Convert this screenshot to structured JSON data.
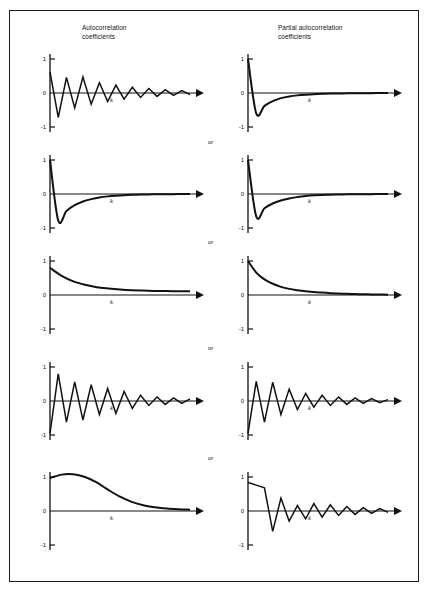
{
  "figure": {
    "frame_color": "#1a1a1a",
    "background": "#ffffff",
    "line_color": "#111111"
  },
  "headers": {
    "left": "Autocorrelation\ncoefficients",
    "right": "Partial autocorrelation\ncoefficients"
  },
  "separators": [
    {
      "label": "or"
    },
    {
      "label": "or"
    },
    {
      "label": "or"
    },
    {
      "label": "or"
    }
  ],
  "axis": {
    "y_ticks": [
      "1",
      "0",
      "-1"
    ],
    "x_label": "k",
    "y_max": 1,
    "y_min": -1,
    "arrowhead": "right-triangle"
  },
  "chart_data": [
    {
      "id": "row1-acf",
      "type": "line",
      "title": "",
      "xlabel": "k",
      "ylabel": "",
      "ylim": [
        -1,
        1
      ],
      "grid": false,
      "pattern": "damped alternating oscillation",
      "x": [
        0,
        1,
        2,
        3,
        4,
        5,
        6,
        7,
        8,
        9,
        10,
        11,
        12,
        13,
        14,
        15,
        16,
        17
      ],
      "values": [
        0.62,
        -0.72,
        0.46,
        -0.44,
        0.47,
        -0.33,
        0.3,
        -0.25,
        0.23,
        -0.18,
        0.17,
        -0.13,
        0.13,
        -0.1,
        0.1,
        -0.07,
        0.07,
        -0.05
      ]
    },
    {
      "id": "row1-pacf",
      "type": "line",
      "title": "",
      "xlabel": "k",
      "ylabel": "",
      "ylim": [
        -1,
        1
      ],
      "grid": false,
      "pattern": "single negative spike then exponential recovery",
      "x": [
        0,
        1,
        2,
        3,
        4,
        5,
        6,
        7,
        8,
        9,
        10,
        11,
        12,
        13,
        14,
        15,
        16,
        17
      ],
      "values": [
        1.0,
        -0.6,
        -0.38,
        -0.24,
        -0.15,
        -0.1,
        -0.07,
        -0.05,
        -0.035,
        -0.025,
        -0.018,
        -0.013,
        -0.01,
        -0.008,
        -0.006,
        -0.004,
        -0.003,
        -0.002
      ]
    },
    {
      "id": "row2-acf",
      "type": "line",
      "title": "",
      "xlabel": "k",
      "ylabel": "",
      "ylim": [
        -1,
        1
      ],
      "grid": false,
      "pattern": "sharp drop to negative then exponential decay to zero",
      "x": [
        0,
        1,
        2,
        3,
        4,
        5,
        6,
        7,
        8,
        9,
        10,
        11,
        12,
        13,
        14,
        15,
        16,
        17
      ],
      "values": [
        1.0,
        -0.78,
        -0.5,
        -0.33,
        -0.22,
        -0.15,
        -0.1,
        -0.07,
        -0.05,
        -0.035,
        -0.025,
        -0.018,
        -0.012,
        -0.009,
        -0.006,
        -0.004,
        -0.003,
        -0.002
      ]
    },
    {
      "id": "row2-pacf",
      "type": "line",
      "title": "",
      "xlabel": "k",
      "ylabel": "",
      "ylim": [
        -1,
        1
      ],
      "grid": false,
      "pattern": "sharp drop to negative then exponential decay to zero",
      "x": [
        0,
        1,
        2,
        3,
        4,
        5,
        6,
        7,
        8,
        9,
        10,
        11,
        12,
        13,
        14,
        15,
        16,
        17
      ],
      "values": [
        1.0,
        -0.66,
        -0.42,
        -0.28,
        -0.19,
        -0.13,
        -0.09,
        -0.06,
        -0.04,
        -0.03,
        -0.02,
        -0.015,
        -0.01,
        -0.007,
        -0.005,
        -0.004,
        -0.002,
        -0.001
      ]
    },
    {
      "id": "row3-acf",
      "type": "line",
      "title": "",
      "xlabel": "k",
      "ylabel": "",
      "ylim": [
        -1,
        1
      ],
      "grid": false,
      "pattern": "positive exponential decay",
      "x": [
        0,
        1,
        2,
        3,
        4,
        5,
        6,
        7,
        8,
        9,
        10,
        11,
        12
      ],
      "values": [
        0.8,
        0.56,
        0.4,
        0.3,
        0.23,
        0.19,
        0.16,
        0.14,
        0.13,
        0.12,
        0.115,
        0.11,
        0.11
      ]
    },
    {
      "id": "row3-pacf",
      "type": "line",
      "title": "",
      "xlabel": "k",
      "ylabel": "",
      "ylim": [
        -1,
        1
      ],
      "grid": false,
      "pattern": "positive exponential decay from unity",
      "x": [
        0,
        1,
        2,
        3,
        4,
        5,
        6,
        7,
        8,
        9,
        10,
        11,
        12,
        13,
        14,
        15,
        16,
        17
      ],
      "values": [
        1.0,
        0.66,
        0.46,
        0.33,
        0.24,
        0.18,
        0.14,
        0.11,
        0.09,
        0.07,
        0.055,
        0.045,
        0.035,
        0.028,
        0.022,
        0.017,
        0.013,
        0.01
      ]
    },
    {
      "id": "row4-acf",
      "type": "line",
      "title": "",
      "xlabel": "k",
      "ylabel": "",
      "ylim": [
        -1,
        1
      ],
      "grid": false,
      "pattern": "negative spike then damped oscillation",
      "x": [
        0,
        1,
        2,
        3,
        4,
        5,
        6,
        7,
        8,
        9,
        10,
        11,
        12,
        13,
        14,
        15,
        16,
        17
      ],
      "values": [
        -0.95,
        0.8,
        -0.62,
        0.56,
        -0.56,
        0.48,
        -0.4,
        0.37,
        -0.37,
        0.28,
        -0.22,
        0.17,
        -0.13,
        0.12,
        -0.1,
        0.09,
        -0.07,
        0.06
      ]
    },
    {
      "id": "row4-pacf",
      "type": "line",
      "title": "",
      "xlabel": "k",
      "ylabel": "",
      "ylim": [
        -1,
        1
      ],
      "grid": false,
      "pattern": "negative spike then damped oscillation",
      "x": [
        0,
        1,
        2,
        3,
        4,
        5,
        6,
        7,
        8,
        9,
        10,
        11,
        12,
        13,
        14,
        15,
        16,
        17
      ],
      "values": [
        -0.95,
        0.58,
        -0.62,
        0.55,
        -0.4,
        0.35,
        -0.25,
        0.22,
        -0.18,
        0.17,
        -0.13,
        0.12,
        -0.1,
        0.09,
        -0.07,
        0.07,
        -0.05,
        0.04
      ]
    },
    {
      "id": "row5-acf",
      "type": "line",
      "title": "",
      "xlabel": "k",
      "ylabel": "",
      "ylim": [
        -1,
        1
      ],
      "grid": false,
      "pattern": "slow hump then smooth decay to zero",
      "x": [
        0,
        1,
        2,
        3,
        4,
        5,
        6,
        7,
        8,
        9,
        10,
        11,
        12
      ],
      "values": [
        0.97,
        1.07,
        1.08,
        1.0,
        0.84,
        0.62,
        0.42,
        0.27,
        0.17,
        0.11,
        0.07,
        0.05,
        0.04
      ]
    },
    {
      "id": "row5-pacf",
      "type": "line",
      "title": "",
      "xlabel": "k",
      "ylabel": "",
      "ylim": [
        -1,
        1
      ],
      "grid": false,
      "pattern": "high positive start, drop to negative, then damped oscillation",
      "x": [
        0,
        1,
        2,
        3,
        4,
        5,
        6,
        7,
        8,
        9,
        10,
        11,
        12,
        13,
        14,
        15,
        16,
        17
      ],
      "values": [
        0.84,
        0.76,
        0.68,
        -0.6,
        0.38,
        -0.3,
        0.16,
        -0.23,
        0.22,
        -0.18,
        0.18,
        -0.13,
        0.13,
        -0.1,
        0.1,
        -0.07,
        0.07,
        -0.04
      ]
    }
  ]
}
